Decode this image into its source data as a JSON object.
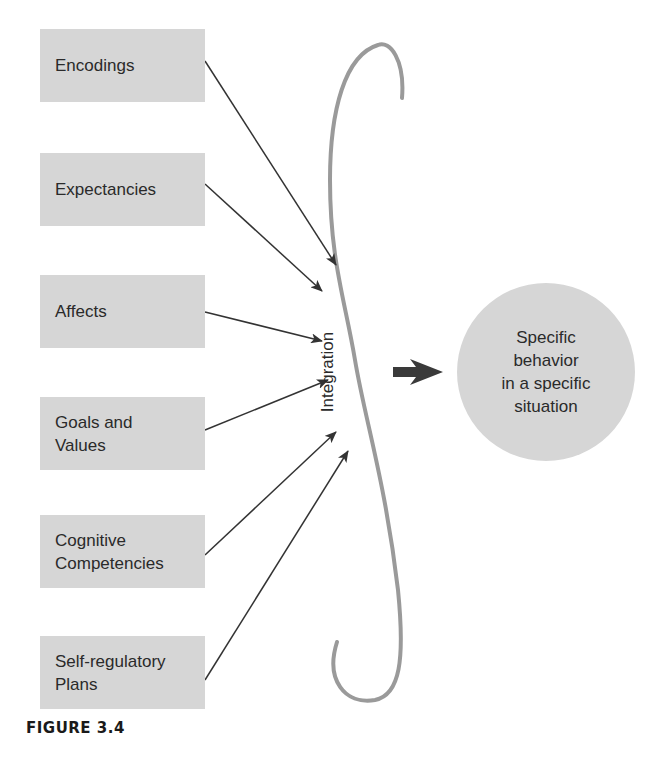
{
  "diagram": {
    "inputs": [
      {
        "label": "Encodings"
      },
      {
        "label": "Expectancies"
      },
      {
        "label": "Affects"
      },
      {
        "label": "Goals and\nValues"
      },
      {
        "label": "Cognitive\nCompetencies"
      },
      {
        "label": "Self-regulatory\nPlans"
      }
    ],
    "integration_label": "Integration",
    "output_label": "Specific\nbehavior\nin a specific\nsituation",
    "caption": "FIGURE 3.4",
    "colors": {
      "box_fill": "#d6d6d6",
      "bracket": "#999999",
      "arrow": "#333333"
    }
  }
}
